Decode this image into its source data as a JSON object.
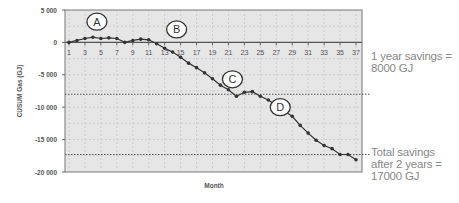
{
  "chart_data": {
    "type": "line",
    "title": "",
    "xlabel": "Month",
    "ylabel": "CUSUM Gas (GJ)",
    "ylim": [
      -20000,
      5000
    ],
    "xlim": [
      1,
      37
    ],
    "yticks": [
      5000,
      0,
      -5000,
      -10000,
      -15000,
      -20000
    ],
    "ytick_labels": [
      "5 000",
      "0",
      "-5 000",
      "-10 000",
      "-15 000",
      "-20 000"
    ],
    "xtick_labels": [
      "1",
      "3",
      "5",
      "7",
      "9",
      "11",
      "13",
      "15",
      "17",
      "19",
      "21",
      "23",
      "25",
      "27",
      "29",
      "31",
      "33",
      "35",
      "37"
    ],
    "grid": true,
    "legend": null,
    "x": [
      1,
      2,
      3,
      4,
      5,
      6,
      7,
      8,
      9,
      10,
      11,
      12,
      13,
      14,
      15,
      16,
      17,
      18,
      19,
      20,
      21,
      22,
      23,
      24,
      25,
      26,
      27,
      28,
      29,
      30,
      31,
      32,
      33,
      34,
      35,
      36,
      37
    ],
    "series": [
      {
        "name": "CUSUM Gas",
        "values": [
          0,
          300,
          600,
          800,
          600,
          700,
          600,
          0,
          300,
          500,
          400,
          -200,
          -900,
          -1500,
          -2300,
          -3200,
          -3900,
          -4700,
          -5600,
          -6600,
          -7300,
          -8300,
          -7700,
          -7600,
          -8300,
          -8900,
          -9700,
          -10600,
          -11400,
          -12800,
          -14000,
          -15100,
          -15900,
          -16400,
          -17300,
          -17300,
          -18100
        ]
      }
    ],
    "reference_lines": [
      {
        "y": -8000,
        "style": "dotted",
        "label": "1 year savings = 8000 GJ"
      },
      {
        "y": -17300,
        "style": "dotted",
        "label": "Total savings after 2 years = 17000 GJ"
      }
    ],
    "markers": [
      {
        "label": "A",
        "x": 4.5,
        "y": 3200
      },
      {
        "label": "B",
        "x": 14.5,
        "y": 2000
      },
      {
        "label": "C",
        "x": 21.5,
        "y": -5700
      },
      {
        "label": "D",
        "x": 27.5,
        "y": -10000
      }
    ]
  },
  "annotations": {
    "one_year": [
      "1 year savings =",
      "8000 GJ"
    ],
    "two_years": [
      "Total savings",
      "after 2 years =",
      "17000 GJ"
    ]
  },
  "colors": {
    "plot_bg": "#e6e6e6",
    "line": "#333333",
    "grid": "#bdbdbd",
    "text": "#555555",
    "annotation_text": "#888888"
  }
}
